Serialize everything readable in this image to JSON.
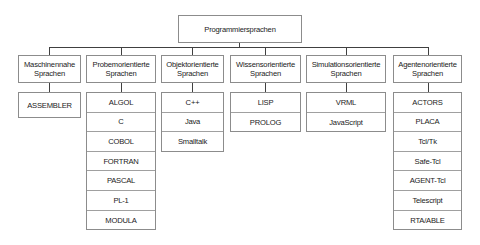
{
  "diagram": {
    "root": "Programmiersprachen",
    "categories": [
      {
        "title_line1": "Maschinennahe",
        "title_line2": "Sprachen",
        "items": [
          "ASSEMBLER"
        ]
      },
      {
        "title_line1": "Probemorientierte",
        "title_line2": "Sprachen",
        "items": [
          "ALGOL",
          "C",
          "COBOL",
          "FORTRAN",
          "PASCAL",
          "PL-1",
          "MODULA"
        ]
      },
      {
        "title_line1": "Objektorientierte",
        "title_line2": "Sprachen",
        "items": [
          "C++",
          "Java",
          "Smalltalk"
        ]
      },
      {
        "title_line1": "Wissensorientierte",
        "title_line2": "Sprachen",
        "items": [
          "LISP",
          "PROLOG"
        ]
      },
      {
        "title_line1": "Simulationsorientierte",
        "title_line2": "Sprachen",
        "items": [
          "VRML",
          "JavaScript"
        ]
      },
      {
        "title_line1": "Agentenorientierte",
        "title_line2": "Sprachen",
        "items": [
          "ACTORS",
          "PLACA",
          "Tcl/Tk",
          "Safe-Tcl",
          "AGENT-Tcl",
          "Telescript",
          "RTA/ABLE"
        ]
      }
    ]
  }
}
